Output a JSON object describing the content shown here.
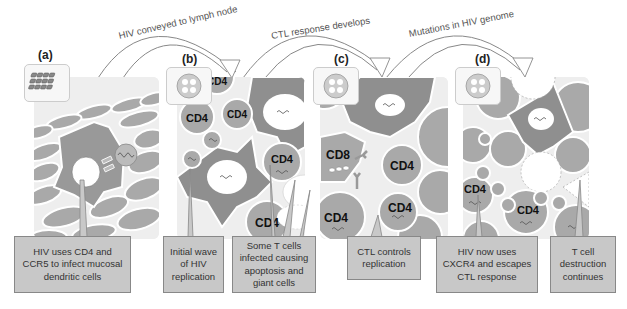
{
  "figure": {
    "arrows": [
      {
        "label": "HIV conveyed to lymph node",
        "from": "a",
        "to": "b"
      },
      {
        "label": "CTL response develops",
        "from": "b",
        "to": "c"
      },
      {
        "label": "Mutations in HIV genome",
        "from": "c",
        "to": "d"
      }
    ],
    "panels": [
      {
        "letter": "(a)",
        "thumb_icon": "epithelium-icon"
      },
      {
        "letter": "(b)",
        "thumb_icon": "lymph-node-icon",
        "cell_labels": [
          "CD4",
          "CD4",
          "CD4",
          "CD4",
          "CD4"
        ]
      },
      {
        "letter": "(c)",
        "thumb_icon": "lymph-node-icon",
        "cell_labels": [
          "CD8",
          "CD4",
          "CD4",
          "CD4"
        ]
      },
      {
        "letter": "(d)",
        "thumb_icon": "lymph-node-icon",
        "cell_labels": [
          "CD4",
          "CD4"
        ]
      }
    ],
    "callouts": [
      {
        "text": "HIV uses CD4 and CCR5 to infect mucosal dendritic cells"
      },
      {
        "text": "Initial wave of HIV replication"
      },
      {
        "text": "Some T cells infected causing apoptosis and giant cells"
      },
      {
        "text": "CTL controls replication"
      },
      {
        "text": "HIV now uses CXCR4 and escapes CTL response"
      },
      {
        "text": "T cell destruction continues"
      }
    ],
    "colors": {
      "cell_fill": "#a9a9a9",
      "dark_fill": "#8f8f8f",
      "background": "#e6e6e6",
      "callout_fill": "#c8c8c8",
      "outline": "#ffffff"
    }
  }
}
